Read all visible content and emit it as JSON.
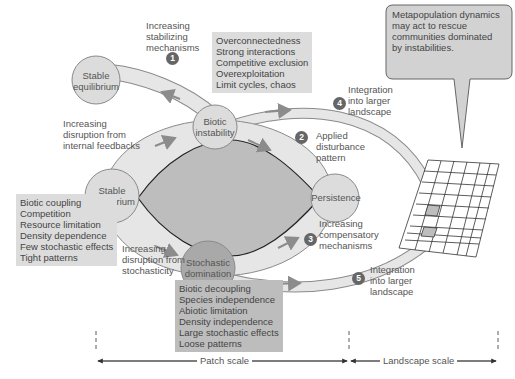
{
  "diagram": {
    "nodes": {
      "stable_top": "Stable\nequilibrium",
      "biotic_instability": "Biotic\ninstability",
      "stable_left": "Stable\nequilibrium",
      "persistence": "Persistence",
      "stochastic_domination": "Stochastic\ndomination"
    },
    "pathways": [
      {
        "number": "1",
        "label": "Increasing\nstabilizing\nmechanisms"
      },
      {
        "number": "2",
        "label": "Applied\ndisturbance\npattern"
      },
      {
        "number": "3",
        "label": "Increasing\ncompensatory\nmechanisms"
      },
      {
        "number": "4",
        "label": "Integration\ninto larger\nlandscape"
      },
      {
        "number": "5",
        "label": "Integration\ninto larger\nlandscape"
      }
    ],
    "side_labels": {
      "internal": "Increasing\ndisruption from\ninternal feedbacks",
      "stochastic": "Increasing\ndisruption from\nstochasticity"
    },
    "boxes": {
      "instability_traits": "Overconnectedness\nStrong interactions\nCompetitive exclusion\nOverexploitation\nLimit cycles, chaos",
      "equilibrium_traits": "Biotic coupling\nCompetition\nResource limitation\nDensity dependence\nFew stochastic effects\nTight patterns",
      "stochastic_traits": "Biotic decoupling\nSpecies independence\nAbiotic limitation\nDensity independence\nLarge stochastic effects\nLoose patterns"
    },
    "callout": "Metapopulation dynamics\nmay act to rescue\ncommunities dominated\nby instabilities.",
    "scale_bar": {
      "patch": "Patch scale",
      "landscape": "Landscape scale"
    },
    "colors": {
      "band": "#e6e6e6",
      "band_stroke": "#8a8a8a",
      "inner": "#bdbdbd",
      "node_light": "#dcdcdc",
      "node_dark": "#a9a9a9",
      "arrow": "#8c8c8c",
      "grid_highlight": "#bdbdbd"
    }
  }
}
